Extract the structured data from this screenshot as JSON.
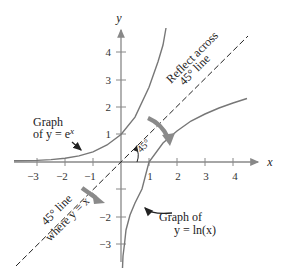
{
  "diagram": {
    "type": "function-graph",
    "axes": {
      "x_label": "x",
      "y_label": "y",
      "x_ticks": [
        "−3",
        "−2",
        "−1",
        "1",
        "2",
        "3",
        "4"
      ],
      "y_ticks_pos": [
        "1",
        "2",
        "3",
        "4"
      ],
      "y_ticks_neg": [
        "−2",
        "−3"
      ]
    },
    "curves": [
      {
        "name": "exp",
        "label_line1": "Graph",
        "label_line2_prefix": "of y = e",
        "label_superscript": "x"
      },
      {
        "name": "ln",
        "label_line1": "Graph of",
        "label_line2": "y = ln(x)"
      }
    ],
    "reflection_line": {
      "label_line1": "Reflect across",
      "label_line2": "45° line",
      "lower_label_line1": "45° line",
      "lower_label_line2": "where y = x"
    },
    "angle_label": "45°",
    "colors": {
      "axis": "#888888",
      "curve": "#777777",
      "dashed_line": "#222222",
      "arrow": "#8a8a8a",
      "text": "#222222"
    }
  }
}
